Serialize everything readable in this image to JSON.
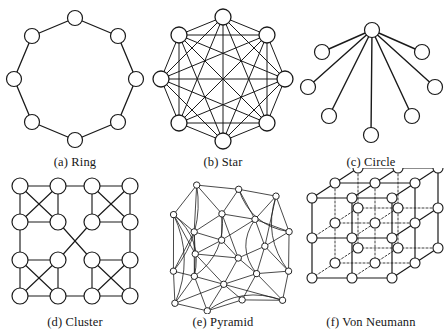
{
  "figure": {
    "type": "network-topology-diagram-grid",
    "rows": 2,
    "columns": 3,
    "background_color": "#ffffff",
    "node_fill": "#ffffff",
    "node_stroke": "#1a1a1a",
    "edge_color": "#1a1a1a",
    "caption_color": "#161616"
  },
  "panels": [
    {
      "id": "ring",
      "caption": "(a) Ring",
      "label": "(a)",
      "name": "Ring",
      "node_count": 8,
      "edge_count": 8,
      "node_radius": 7.5,
      "description": "Eight nodes arranged on an octagon, each connected to its two neighbours forming a closed loop.",
      "nodes": [
        {
          "id": 0,
          "x": 75,
          "y": 14
        },
        {
          "id": 1,
          "x": 118,
          "y": 32
        },
        {
          "id": 2,
          "x": 136,
          "y": 75
        },
        {
          "id": 3,
          "x": 118,
          "y": 118
        },
        {
          "id": 4,
          "x": 75,
          "y": 136
        },
        {
          "id": 5,
          "x": 32,
          "y": 118
        },
        {
          "id": 6,
          "x": 14,
          "y": 75
        },
        {
          "id": 7,
          "x": 32,
          "y": 32
        }
      ],
      "edges": [
        [
          0,
          1
        ],
        [
          1,
          2
        ],
        [
          2,
          3
        ],
        [
          3,
          4
        ],
        [
          4,
          5
        ],
        [
          5,
          6
        ],
        [
          6,
          7
        ],
        [
          7,
          0
        ]
      ]
    },
    {
      "id": "star",
      "caption": "(b) Star",
      "label": "(b)",
      "name": "Star",
      "node_count": 8,
      "edge_count": 28,
      "node_radius": 8,
      "description": "Eight nodes on an octagon fully interconnected - every node links to every other node (complete graph).",
      "nodes": [
        {
          "id": 0,
          "x": 75,
          "y": 13
        },
        {
          "id": 1,
          "x": 119,
          "y": 31
        },
        {
          "id": 2,
          "x": 137,
          "y": 75
        },
        {
          "id": 3,
          "x": 119,
          "y": 119
        },
        {
          "id": 4,
          "x": 75,
          "y": 137
        },
        {
          "id": 5,
          "x": 31,
          "y": 119
        },
        {
          "id": 6,
          "x": 13,
          "y": 75
        },
        {
          "id": 7,
          "x": 31,
          "y": 31
        }
      ],
      "edges": [
        [
          0,
          1
        ],
        [
          0,
          2
        ],
        [
          0,
          3
        ],
        [
          0,
          4
        ],
        [
          0,
          5
        ],
        [
          0,
          6
        ],
        [
          0,
          7
        ],
        [
          1,
          2
        ],
        [
          1,
          3
        ],
        [
          1,
          4
        ],
        [
          1,
          5
        ],
        [
          1,
          6
        ],
        [
          1,
          7
        ],
        [
          2,
          3
        ],
        [
          2,
          4
        ],
        [
          2,
          5
        ],
        [
          2,
          6
        ],
        [
          2,
          7
        ],
        [
          3,
          4
        ],
        [
          3,
          5
        ],
        [
          3,
          6
        ],
        [
          3,
          7
        ],
        [
          4,
          5
        ],
        [
          4,
          6
        ],
        [
          4,
          7
        ],
        [
          5,
          6
        ],
        [
          5,
          7
        ],
        [
          6,
          7
        ]
      ]
    },
    {
      "id": "circle",
      "caption": "(c) Circle",
      "label": "(c)",
      "name": "Circle",
      "node_count": 8,
      "edge_count": 7,
      "node_radius": 7.5,
      "description": "A single hub node at the top centre with seven spokes fanning out to the surrounding leaf nodes.",
      "hub_id": 0,
      "nodes": [
        {
          "id": 0,
          "x": 76,
          "y": 26
        },
        {
          "id": 1,
          "x": 26,
          "y": 48
        },
        {
          "id": 2,
          "x": 126,
          "y": 48
        },
        {
          "id": 3,
          "x": 12,
          "y": 83
        },
        {
          "id": 4,
          "x": 139,
          "y": 83
        },
        {
          "id": 5,
          "x": 33,
          "y": 112
        },
        {
          "id": 6,
          "x": 116,
          "y": 112
        },
        {
          "id": 7,
          "x": 75,
          "y": 131
        }
      ],
      "edges": [
        [
          0,
          1
        ],
        [
          0,
          2
        ],
        [
          0,
          3
        ],
        [
          0,
          4
        ],
        [
          0,
          5
        ],
        [
          0,
          6
        ],
        [
          0,
          7
        ]
      ]
    },
    {
      "id": "cluster",
      "caption": "(d) Cluster",
      "label": "(d)",
      "name": "Cluster",
      "node_count": 16,
      "node_radius": 8,
      "cluster_count": 4,
      "nodes_per_cluster": 4,
      "description": "Four fully-connected groups of four nodes placed at the corners; the groups are joined by perimeter links and two long diagonals that cross in the centre.",
      "nodes": [
        {
          "id": 0,
          "x": 20,
          "y": 18
        },
        {
          "id": 1,
          "x": 58,
          "y": 18
        },
        {
          "id": 2,
          "x": 20,
          "y": 54
        },
        {
          "id": 3,
          "x": 58,
          "y": 54
        },
        {
          "id": 4,
          "x": 92,
          "y": 18
        },
        {
          "id": 5,
          "x": 130,
          "y": 18
        },
        {
          "id": 6,
          "x": 92,
          "y": 54
        },
        {
          "id": 7,
          "x": 130,
          "y": 54
        },
        {
          "id": 8,
          "x": 20,
          "y": 92
        },
        {
          "id": 9,
          "x": 58,
          "y": 92
        },
        {
          "id": 10,
          "x": 20,
          "y": 128
        },
        {
          "id": 11,
          "x": 58,
          "y": 128
        },
        {
          "id": 12,
          "x": 92,
          "y": 92
        },
        {
          "id": 13,
          "x": 130,
          "y": 92
        },
        {
          "id": 14,
          "x": 92,
          "y": 128
        },
        {
          "id": 15,
          "x": 130,
          "y": 128
        }
      ],
      "intra_cluster_edges": [
        [
          0,
          1
        ],
        [
          0,
          2
        ],
        [
          0,
          3
        ],
        [
          1,
          2
        ],
        [
          1,
          3
        ],
        [
          2,
          3
        ],
        [
          4,
          5
        ],
        [
          4,
          6
        ],
        [
          4,
          7
        ],
        [
          5,
          6
        ],
        [
          5,
          7
        ],
        [
          6,
          7
        ],
        [
          8,
          9
        ],
        [
          8,
          10
        ],
        [
          8,
          11
        ],
        [
          9,
          10
        ],
        [
          9,
          11
        ],
        [
          10,
          11
        ],
        [
          12,
          13
        ],
        [
          12,
          14
        ],
        [
          12,
          15
        ],
        [
          13,
          14
        ],
        [
          13,
          15
        ],
        [
          14,
          15
        ]
      ],
      "inter_cluster_edges": [
        [
          1,
          4
        ],
        [
          2,
          8
        ],
        [
          7,
          13
        ],
        [
          11,
          14
        ],
        [
          3,
          12
        ],
        [
          6,
          9
        ]
      ]
    },
    {
      "id": "pyramid",
      "caption": "(e) Pyramid",
      "label": "(e)",
      "name": "Pyramid",
      "node_count": 21,
      "node_radius": 3.2,
      "description": "A dense, slightly rotated hierarchical mesh with small nodes connected by straight and curved links at several levels.",
      "rotation_deg": -8,
      "nodes": [
        {
          "id": 0,
          "x": 22,
          "y": 96
        },
        {
          "id": 1,
          "x": 30,
          "y": 40
        },
        {
          "id": 2,
          "x": 57,
          "y": 14
        },
        {
          "id": 3,
          "x": 98,
          "y": 24
        },
        {
          "id": 4,
          "x": 134,
          "y": 36
        },
        {
          "id": 5,
          "x": 142,
          "y": 73
        },
        {
          "id": 6,
          "x": 136,
          "y": 112
        },
        {
          "id": 7,
          "x": 126,
          "y": 140
        },
        {
          "id": 8,
          "x": 86,
          "y": 134
        },
        {
          "id": 9,
          "x": 50,
          "y": 140
        },
        {
          "id": 10,
          "x": 19,
          "y": 128
        },
        {
          "id": 11,
          "x": 48,
          "y": 60
        },
        {
          "id": 12,
          "x": 78,
          "y": 46
        },
        {
          "id": 13,
          "x": 110,
          "y": 56
        },
        {
          "id": 14,
          "x": 116,
          "y": 84
        },
        {
          "id": 15,
          "x": 104,
          "y": 110
        },
        {
          "id": 16,
          "x": 70,
          "y": 116
        },
        {
          "id": 17,
          "x": 42,
          "y": 104
        },
        {
          "id": 18,
          "x": 46,
          "y": 82
        },
        {
          "id": 19,
          "x": 74,
          "y": 72
        },
        {
          "id": 20,
          "x": 88,
          "y": 92
        }
      ],
      "edges": [
        [
          0,
          1
        ],
        [
          1,
          2
        ],
        [
          2,
          3
        ],
        [
          3,
          4
        ],
        [
          4,
          5
        ],
        [
          5,
          6
        ],
        [
          6,
          7
        ],
        [
          7,
          8
        ],
        [
          8,
          9
        ],
        [
          9,
          10
        ],
        [
          10,
          0
        ],
        [
          0,
          17
        ],
        [
          1,
          11
        ],
        [
          2,
          12
        ],
        [
          3,
          13
        ],
        [
          4,
          13
        ],
        [
          5,
          14
        ],
        [
          6,
          15
        ],
        [
          7,
          15
        ],
        [
          8,
          16
        ],
        [
          9,
          16
        ],
        [
          10,
          17
        ],
        [
          11,
          12
        ],
        [
          12,
          13
        ],
        [
          13,
          14
        ],
        [
          14,
          15
        ],
        [
          15,
          16
        ],
        [
          16,
          17
        ],
        [
          17,
          11
        ],
        [
          11,
          18
        ],
        [
          12,
          19
        ],
        [
          13,
          19
        ],
        [
          14,
          20
        ],
        [
          15,
          20
        ],
        [
          16,
          20
        ],
        [
          17,
          18
        ],
        [
          18,
          19
        ],
        [
          19,
          20
        ],
        [
          18,
          20
        ],
        [
          0,
          11
        ],
        [
          2,
          11
        ],
        [
          3,
          12
        ],
        [
          5,
          13
        ],
        [
          6,
          14
        ],
        [
          8,
          15
        ],
        [
          9,
          17
        ],
        [
          10,
          16
        ],
        [
          1,
          18
        ],
        [
          4,
          14
        ],
        [
          7,
          16
        ],
        [
          19,
          11
        ],
        [
          20,
          12
        ],
        [
          18,
          16
        ]
      ],
      "curved_edges": [
        [
          2,
          0
        ],
        [
          4,
          6
        ],
        [
          9,
          7
        ],
        [
          10,
          1
        ],
        [
          12,
          17
        ],
        [
          13,
          15
        ],
        [
          1,
          17
        ],
        [
          3,
          5
        ]
      ]
    },
    {
      "id": "von-neumann",
      "caption": "(f) Von Neumann",
      "label": "(f)",
      "name": "Von Neumann",
      "node_count": 27,
      "node_radius": 5,
      "grid": [
        3,
        3,
        3
      ],
      "description": "A 3x3x3 cubic lattice drawn in isometric projection; visible front edges are solid and hidden interior edges are dotted.",
      "solid_edge_style": "solid",
      "hidden_edge_style": "dotted"
    }
  ]
}
